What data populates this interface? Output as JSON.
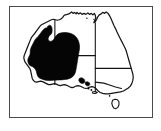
{
  "figure": {
    "kind": "distribution-map",
    "region": "Australia",
    "frame": {
      "border_color": "#4a4a4a",
      "background_color": "#ffffff",
      "x": 9,
      "y": 6,
      "width": 144,
      "height": 112
    },
    "caption": "",
    "title": ""
  },
  "map": {
    "outline_color": "#141414",
    "land_fill_color": "#ffffff",
    "shading_color": "#050505",
    "shading_label": "distribution range",
    "features": [
      {
        "name": "mainland-australia",
        "kind": "landmass",
        "label": "Australia"
      },
      {
        "name": "tasmania",
        "kind": "island",
        "label": "Tasmania"
      },
      {
        "name": "kangaroo-island",
        "kind": "island",
        "label": "Kangaroo Island"
      }
    ],
    "state_borders": [
      {
        "name": "wa-nt-sa-border",
        "label": "Western Australia border"
      },
      {
        "name": "nt-sa-border",
        "label": "Northern Territory / South Australia border"
      },
      {
        "name": "sa-qld-nsw-vic-border",
        "label": "South Australia eastern border"
      },
      {
        "name": "qld-nsw-border",
        "label": "Queensland / New South Wales border"
      },
      {
        "name": "nsw-vic-border",
        "label": "New South Wales / Victoria border"
      }
    ],
    "shaded_regions": [
      {
        "name": "primary-range",
        "label": "Main shaded distribution area",
        "covers": "Western Australia and western South Australia"
      },
      {
        "name": "southern-outlier",
        "label": "Southern coastal outlier patch",
        "covers": "Southern South Australia"
      }
    ]
  },
  "legend": {
    "present": false,
    "entries": []
  },
  "axes": {
    "present": false,
    "tick_labels": []
  }
}
